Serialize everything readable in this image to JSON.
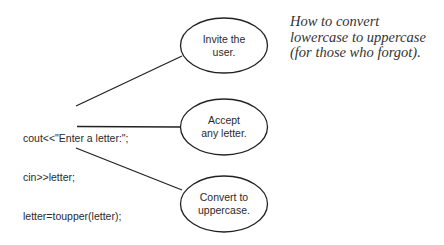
{
  "diagram": {
    "code_lines": [
      "cout<<\"Enter a letter:\";",
      "cin>>letter;",
      "letter=toupper(letter);"
    ],
    "bubbles": [
      {
        "line1": "Invite the",
        "line2": "user."
      },
      {
        "line1": "Accept",
        "line2": "any letter."
      },
      {
        "line1": "Convert to",
        "line2": "uppercase."
      }
    ],
    "caption": "How to convert lowercase to uppercase (for those who forgot).",
    "colors": {
      "stroke": "#222222",
      "text": "#2a2a2a",
      "background": "#ffffff"
    }
  }
}
